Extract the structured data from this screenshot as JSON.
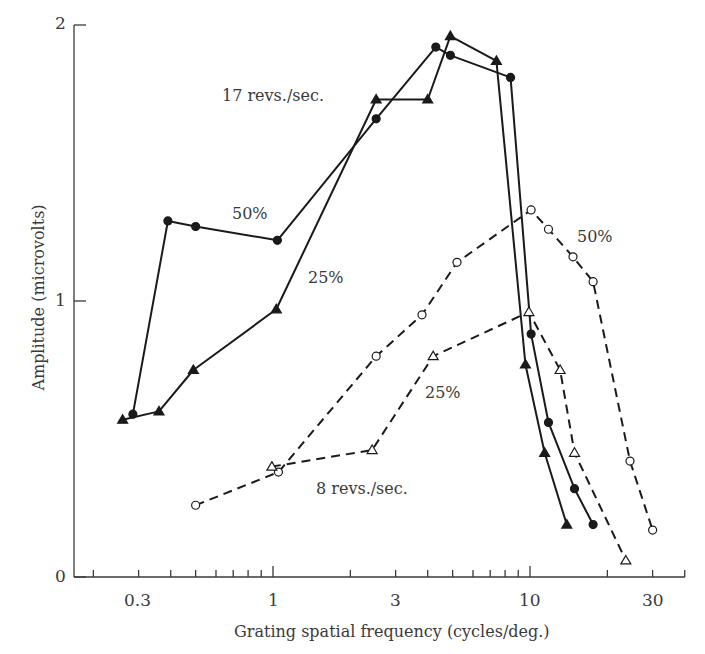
{
  "chart_data": {
    "type": "line",
    "title": "",
    "xlabel": "Grating spatial frequency (cycles/deg.)",
    "ylabel": "Amplitude (microvolts)",
    "xscale": "log",
    "xlim": [
      0.17,
      40
    ],
    "ylim": [
      0,
      2
    ],
    "x_ticks": [
      0.3,
      1,
      3,
      10,
      30
    ],
    "x_tick_labels": [
      "0.3",
      "1",
      "3",
      "10",
      "30"
    ],
    "y_ticks": [
      0,
      1,
      2
    ],
    "y_tick_labels": [
      "0",
      "1",
      "2"
    ],
    "grid": false,
    "legend": "none (inline annotations)",
    "series": [
      {
        "name": "17 revs./sec., 50%",
        "marker": "filled-circle",
        "line": "solid",
        "x": [
          0.285,
          0.39,
          0.5,
          1.04,
          2.52,
          4.3,
          4.9,
          8.4,
          10.1,
          11.8,
          14.9,
          17.6
        ],
        "y": [
          0.59,
          1.29,
          1.27,
          1.22,
          1.66,
          1.92,
          1.89,
          1.81,
          0.88,
          0.56,
          0.32,
          0.19
        ]
      },
      {
        "name": "17 revs./sec., 25%",
        "marker": "filled-triangle",
        "line": "solid",
        "x": [
          0.26,
          0.36,
          0.49,
          1.03,
          2.52,
          4.0,
          4.9,
          7.4,
          9.6,
          11.4,
          13.9
        ],
        "y": [
          0.57,
          0.6,
          0.75,
          0.97,
          1.73,
          1.73,
          1.96,
          1.87,
          0.77,
          0.45,
          0.19
        ]
      },
      {
        "name": "8 revs./sec., 50%",
        "marker": "open-circle",
        "line": "dashed",
        "x": [
          0.5,
          1.05,
          2.52,
          3.8,
          5.2,
          10.1,
          11.8,
          14.7,
          17.6,
          24.5,
          30
        ],
        "y": [
          0.26,
          0.38,
          0.8,
          0.95,
          1.14,
          1.33,
          1.26,
          1.16,
          1.07,
          0.42,
          0.17
        ]
      },
      {
        "name": "8 revs./sec., 25%",
        "marker": "open-triangle",
        "line": "dashed",
        "x": [
          0.99,
          2.43,
          4.2,
          9.9,
          13.1,
          14.9,
          23.6
        ],
        "y": [
          0.4,
          0.46,
          0.8,
          0.96,
          0.75,
          0.45,
          0.06
        ]
      }
    ],
    "annotations": [
      {
        "text": "17 revs./sec.",
        "x": 1.3,
        "y": 1.75
      },
      {
        "text": "50%",
        "x": 0.62,
        "y": 1.31
      },
      {
        "text": "25%",
        "x": 1.5,
        "y": 1.08
      },
      {
        "text": "50%",
        "x": 14.0,
        "y": 1.22
      },
      {
        "text": "25%",
        "x": 4.2,
        "y": 0.68
      },
      {
        "text": "8 revs./sec.",
        "x": 1.9,
        "y": 0.32
      }
    ]
  },
  "labels": {
    "ylabel": "Amplitude (microvolts)",
    "xlabel": "Grating spatial frequency (cycles/deg.)",
    "x_ticks": [
      "0.3",
      "1",
      "3",
      "10",
      "30"
    ],
    "y_ticks": [
      "0",
      "1",
      "2"
    ],
    "annot_17": "17 revs./sec.",
    "annot_17_50": "50%",
    "annot_17_25": "25%",
    "annot_8_50": "50%",
    "annot_8_25": "25%",
    "annot_8": "8 revs./sec."
  }
}
